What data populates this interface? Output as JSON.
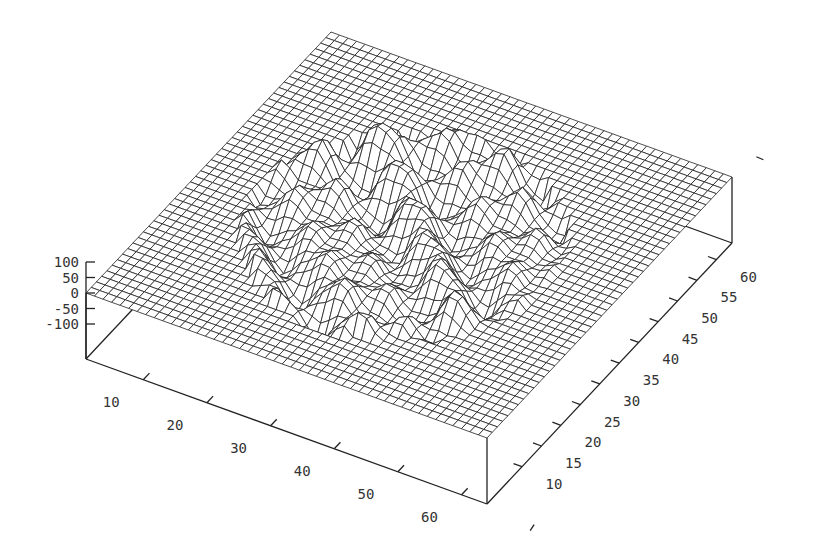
{
  "chart_data": {
    "type": "surface3d",
    "title": "",
    "style": "wireframe mesh with hidden-line removal",
    "grid": {
      "x_samples": 48,
      "y_samples": 48
    },
    "xlabel": "",
    "ylabel": "",
    "zlabel": "",
    "xlim": [
      1,
      64
    ],
    "ylim": [
      1,
      64
    ],
    "zlim": [
      -100,
      100
    ],
    "x_ticks": [
      10,
      20,
      30,
      40,
      50,
      60
    ],
    "y_ticks": [
      10,
      15,
      20,
      25,
      30,
      35,
      40,
      45,
      50,
      55,
      60
    ],
    "z_ticks": [
      100,
      50,
      0,
      -50,
      -100
    ],
    "x_tick_labels": [
      "10",
      "20",
      "30",
      "40",
      "50",
      "60"
    ],
    "y_tick_labels": [
      "10",
      "15",
      "20",
      "25",
      "30",
      "35",
      "40",
      "45",
      "50",
      "55",
      "60"
    ],
    "z_tick_labels": [
      "100",
      "50",
      "0",
      "-50",
      "-100"
    ],
    "surface": {
      "description": "Flat plane z=0 with a central circular region of wavy ridges/valleys (amplitude up to ~100)",
      "center": [
        32,
        32
      ],
      "radius": 22,
      "amplitude": 70,
      "base_z": 0
    },
    "legend": null
  },
  "colors": {
    "background": "#ffffff",
    "mesh": "#222222",
    "axes": "#222222",
    "text": "#333333"
  }
}
